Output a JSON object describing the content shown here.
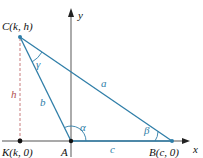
{
  "diagram": {
    "type": "geometry",
    "colors": {
      "axis": "#555555",
      "triangle": "#2f7ea8",
      "altitude": "#c87d7d",
      "point": "#111111",
      "label": "#111111",
      "side_label": "#2f7ea8",
      "angle_label": "#2f7ea8",
      "h_label": "#b05050"
    },
    "axes": {
      "x_label": "x",
      "y_label": "y"
    },
    "points": {
      "C": {
        "label": "C(k, h)"
      },
      "A": {
        "label": "A"
      },
      "B": {
        "label": "B(c, 0)"
      },
      "K": {
        "label": "K(k, 0)"
      }
    },
    "sides": {
      "a": "a",
      "b": "b",
      "c": "c"
    },
    "angles": {
      "alpha": "α",
      "beta": "β",
      "gamma": "γ"
    },
    "altitude": {
      "label": "h"
    }
  }
}
